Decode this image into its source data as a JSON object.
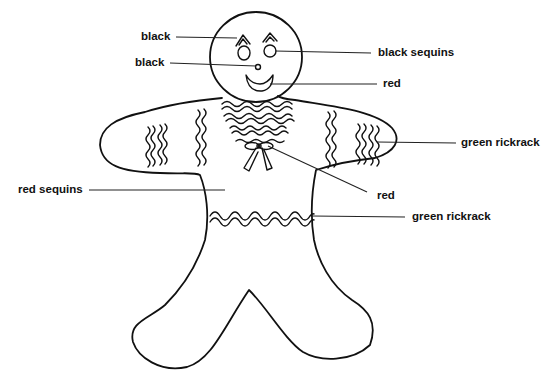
{
  "diagram": {
    "colors": {
      "ink": "#111111",
      "background": "#ffffff"
    },
    "labels": [
      {
        "id": "eyebrows",
        "text": "black",
        "side": "left"
      },
      {
        "id": "nose",
        "text": "black",
        "side": "left"
      },
      {
        "id": "eyes",
        "text": "black sequins",
        "side": "right"
      },
      {
        "id": "mouth",
        "text": "red",
        "side": "right"
      },
      {
        "id": "arm-trim",
        "text": "green rickrack",
        "side": "right"
      },
      {
        "id": "bow",
        "text": "red",
        "side": "right"
      },
      {
        "id": "buttons",
        "text": "red sequins",
        "side": "left"
      },
      {
        "id": "waist-trim",
        "text": "green rickrack",
        "side": "right"
      }
    ]
  }
}
